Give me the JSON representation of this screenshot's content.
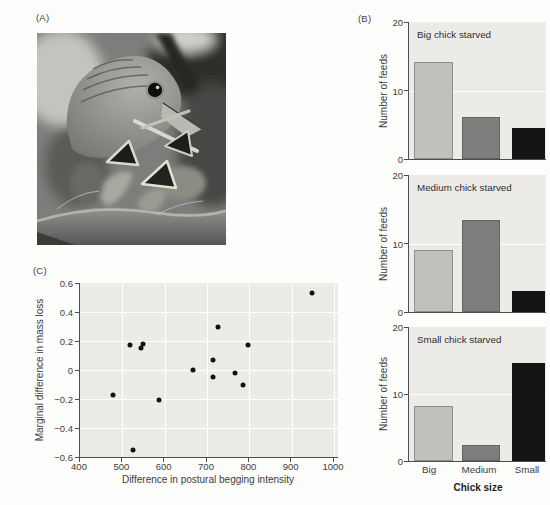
{
  "panels": {
    "a": {
      "label": "(A)",
      "photo_description": "Grayscale photograph of an adult bird at its nest feeding open-mouthed begging chicks"
    },
    "b": {
      "label": "(B)"
    },
    "c": {
      "label": "(C)"
    }
  },
  "chart_data": [
    {
      "type": "bar",
      "title": "Big chick starved",
      "categories": [
        "Big",
        "Medium",
        "Small"
      ],
      "values": [
        14.1,
        6.1,
        4.5
      ],
      "ylabel": "Number of feeds",
      "ylim": [
        0,
        20
      ],
      "yticks": [
        0,
        10,
        20
      ],
      "gridlines_y": [
        10
      ],
      "bar_colors": [
        "#c0c0bd",
        "#7e7e7c",
        "#141414"
      ]
    },
    {
      "type": "bar",
      "title": "Medium chick starved",
      "categories": [
        "Big",
        "Medium",
        "Small"
      ],
      "values": [
        9.0,
        13.4,
        3.1
      ],
      "ylabel": "Number of feeds",
      "ylim": [
        0,
        20
      ],
      "yticks": [
        0,
        10,
        20
      ],
      "gridlines_y": [
        10
      ],
      "bar_colors": [
        "#c0c0bd",
        "#7e7e7c",
        "#141414"
      ]
    },
    {
      "type": "bar",
      "title": "Small chick starved",
      "categories": [
        "Big",
        "Medium",
        "Small"
      ],
      "values": [
        8.2,
        2.4,
        14.7
      ],
      "ylabel": "Number of feeds",
      "xlabel": "Chick size",
      "ylim": [
        0,
        20
      ],
      "yticks": [
        0,
        10,
        20
      ],
      "gridlines_y": [
        10
      ],
      "bar_colors": [
        "#c0c0bd",
        "#7e7e7c",
        "#141414"
      ]
    },
    {
      "type": "scatter",
      "xlabel": "Difference in postural begging intensity",
      "ylabel": "Marginal difference in mass loss",
      "xlim": [
        400,
        1000
      ],
      "ylim": [
        -0.6,
        0.6
      ],
      "xticks": [
        400,
        500,
        600,
        700,
        800,
        900,
        1000
      ],
      "yticks": [
        0.6,
        0.4,
        0.2,
        0,
        -0.2,
        -0.4,
        -0.6
      ],
      "grid": true,
      "points": [
        [
          479,
          -0.17
        ],
        [
          519,
          0.17
        ],
        [
          526,
          -0.55
        ],
        [
          543,
          0.15
        ],
        [
          549,
          0.18
        ],
        [
          586,
          -0.21
        ],
        [
          668,
          0.0
        ],
        [
          714,
          0.07
        ],
        [
          714,
          -0.05
        ],
        [
          726,
          0.3
        ],
        [
          767,
          -0.02
        ],
        [
          786,
          -0.1
        ],
        [
          797,
          0.17
        ],
        [
          947,
          0.53
        ]
      ]
    }
  ],
  "colors": {
    "page_bg": "#fdfdfc",
    "plot_bg": "#ecebe7",
    "axis": "#4d4d4d",
    "grid": "#ffffff",
    "text": "#3c3c3c",
    "dot": "#121212"
  }
}
